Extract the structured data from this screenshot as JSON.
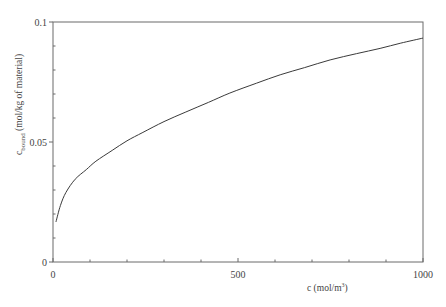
{
  "chart_data": {
    "type": "line",
    "title": "",
    "xlabel": "c (mol/m³)",
    "xlabel_parts": {
      "main": "c (mol/m",
      "sup": "3",
      "tail": ")"
    },
    "ylabel": "c_bound (mol/kg of material)",
    "ylabel_parts": {
      "main": "c",
      "sub": "bound",
      "tail": " (mol/kg of material)"
    },
    "xlim": [
      0,
      1000
    ],
    "ylim": [
      0,
      0.1
    ],
    "x_major_ticks": [
      0,
      500,
      1000
    ],
    "x_tick_labels": [
      "0",
      "500",
      "1000"
    ],
    "x_minor_step": 100,
    "y_major_ticks": [
      0,
      0.05,
      0.1
    ],
    "y_tick_labels": [
      "0",
      "0.05",
      "0.1"
    ],
    "y_minor_step": 0.01,
    "grid": false,
    "legend": null,
    "series": [
      {
        "name": "c_bound",
        "color": "#3a3a3a",
        "x": [
          8,
          20,
          35,
          60,
          90,
          116,
          160,
          200,
          243,
          300,
          359,
          420,
          478,
          550,
          614,
          680,
          749,
          820,
          884,
          940,
          1000
        ],
        "y": [
          0.0167,
          0.0235,
          0.029,
          0.0345,
          0.0385,
          0.042,
          0.0465,
          0.0505,
          0.054,
          0.0585,
          0.0625,
          0.0665,
          0.0704,
          0.0745,
          0.078,
          0.081,
          0.0842,
          0.0868,
          0.089,
          0.0912,
          0.0933
        ]
      }
    ]
  },
  "colors": {
    "axis": "#6b6b6b",
    "text": "#444444",
    "line": "#3a3a3a"
  }
}
